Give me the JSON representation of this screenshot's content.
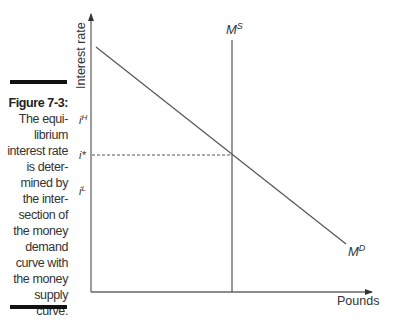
{
  "figure": {
    "label": "Figure 7-3:",
    "caption_lines": [
      "The equi-",
      "librium",
      "interest rate",
      "is deter-",
      "mined by",
      "the inter-",
      "section of",
      "the money",
      "demand",
      "curve with",
      "the money",
      "supply",
      "curve."
    ]
  },
  "axes": {
    "y_label": "Interest rate",
    "x_label": "Pounds"
  },
  "ticks": {
    "high": {
      "base": "i",
      "sup": "H"
    },
    "equilibrium": {
      "base": "i*"
    },
    "low": {
      "base": "i",
      "sup": "L"
    }
  },
  "curves": {
    "supply": {
      "base": "M",
      "sup": "S"
    },
    "demand": {
      "base": "M",
      "sup": "D"
    }
  },
  "colors": {
    "line": "#555555",
    "text": "#333333",
    "bar": "#111111"
  }
}
